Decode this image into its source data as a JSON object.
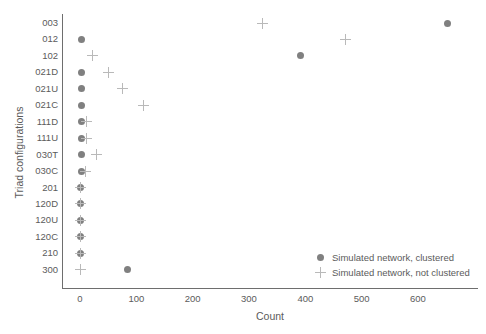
{
  "chart_data": {
    "type": "scatter",
    "title": "",
    "xlabel": "Count",
    "ylabel": "Triad configurations",
    "xlim": [
      -20,
      720
    ],
    "ylim_categories": [
      "003",
      "012",
      "102",
      "021D",
      "021U",
      "021C",
      "111D",
      "111U",
      "030T",
      "030C",
      "201",
      "120D",
      "120U",
      "120C",
      "210",
      "300"
    ],
    "grid": false,
    "legend_position": "lower right",
    "categories": [
      "003",
      "012",
      "102",
      "021D",
      "021U",
      "021C",
      "111D",
      "111U",
      "030T",
      "030C",
      "201",
      "120D",
      "120U",
      "120C",
      "210",
      "300"
    ],
    "series": [
      {
        "name": "Simulated network, clustered",
        "marker": "circle",
        "color": "#808080",
        "values": [
          653,
          2,
          392,
          3,
          3,
          3,
          2,
          2,
          2,
          2,
          1,
          1,
          1,
          1,
          1,
          85
        ]
      },
      {
        "name": "Simulated network, not clustered",
        "marker": "plus",
        "color": "#b9b9b9",
        "values": [
          324,
          472,
          22,
          51,
          76,
          112,
          11,
          12,
          29,
          10,
          1,
          1,
          1,
          1,
          1,
          0
        ]
      }
    ],
    "xticks": [
      0,
      100,
      200,
      300,
      400,
      500,
      600
    ],
    "xticklabels": [
      "0",
      "100",
      "200",
      "300",
      "400",
      "500",
      "600"
    ]
  },
  "axes": {
    "y_axis_title": "Triad configurations",
    "x_axis_title": "Count"
  },
  "legend": {
    "entries": [
      {
        "label": "Simulated network, clustered",
        "marker": "circle"
      },
      {
        "label": "Simulated network, not clustered",
        "marker": "plus"
      }
    ]
  },
  "colors": {
    "dot": "#808080",
    "plus": "#b9b9b9",
    "axis": "#6e6e6e",
    "text": "#5b5b5b",
    "background": "#ffffff"
  }
}
